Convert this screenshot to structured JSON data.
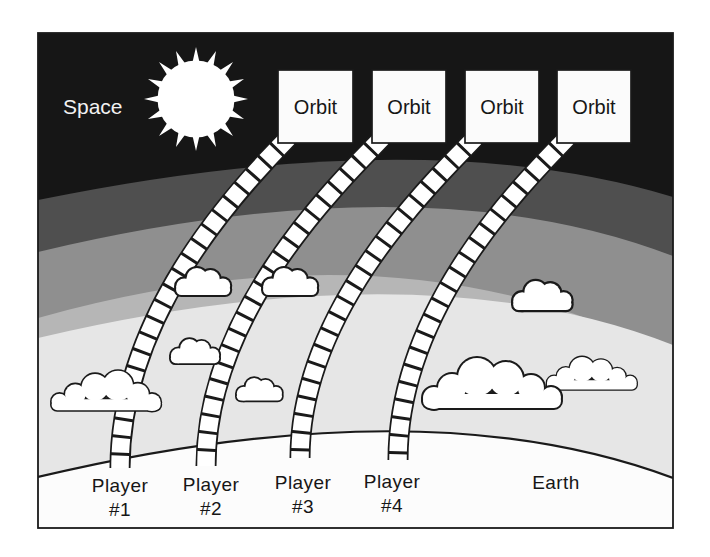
{
  "diagram": {
    "space_label": "Space",
    "earth_label": "Earth",
    "orbit_boxes": [
      {
        "label": "Orbit"
      },
      {
        "label": "Orbit"
      },
      {
        "label": "Orbit"
      },
      {
        "label": "Orbit"
      }
    ],
    "players": [
      {
        "name": "Player",
        "number": "#1"
      },
      {
        "name": "Player",
        "number": "#2"
      },
      {
        "name": "Player",
        "number": "#3"
      },
      {
        "name": "Player",
        "number": "#4"
      }
    ],
    "icons": {
      "sun": "spiked-white-circle",
      "cloud": "cumulus-outline",
      "ladder_track": "segmented-curved-track"
    },
    "colors": {
      "space_black": "#161616",
      "band_dark": "#4f4f4f",
      "band_medium": "#8f8f8f",
      "band_light": "#b6b6b6",
      "band_pale": "#e6e6e6",
      "ground_white": "#fcfcfc",
      "cloud_white": "#ffffff",
      "box_fill": "#fbfbfb",
      "outline_black": "#1a1a1a",
      "label_on_dark": "#f2f2f2",
      "label_on_light": "#161616"
    }
  }
}
